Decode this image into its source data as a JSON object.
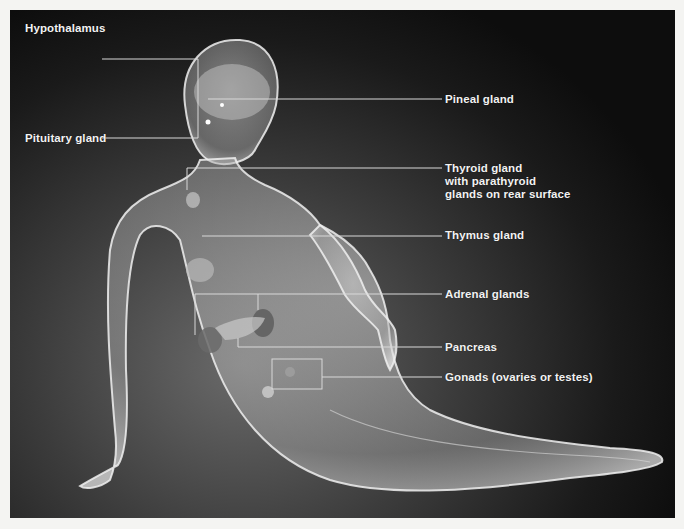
{
  "figure": {
    "type": "anatomical-illustration",
    "background_color": "#1a1a1a",
    "label_color": "#f2f2f2",
    "leader_line_color": "#d8d8d8"
  },
  "labels": {
    "hypothalamus": "Hypothalamus",
    "pituitary": "Pituitary gland",
    "pineal": "Pineal gland",
    "thyroid_line1": "Thyroid gland",
    "thyroid_line2": "with parathyroid",
    "thyroid_line3": "glands on rear surface",
    "thymus": "Thymus gland",
    "adrenal": "Adrenal glands",
    "pancreas": "Pancreas",
    "gonads": "Gonads (ovaries or testes)"
  }
}
